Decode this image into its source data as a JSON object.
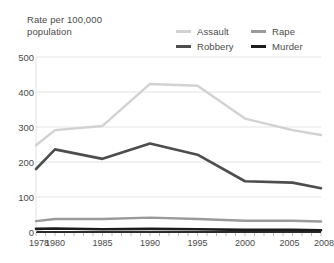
{
  "chart_data": {
    "type": "line",
    "title": "Rate per 100,000\npopulation",
    "xlabel": "",
    "ylabel": "Rate per 100,000 population",
    "x": [
      1978,
      1980,
      1985,
      1990,
      1995,
      2000,
      2005,
      2008
    ],
    "xticklabels": [
      "1978",
      "1980",
      "1985",
      "1990",
      "1995",
      "2000",
      "2005",
      "2008"
    ],
    "yticklabels": [
      "0",
      "100",
      "200",
      "300",
      "400",
      "500"
    ],
    "yticks": [
      0,
      100,
      200,
      300,
      400,
      500
    ],
    "ylim": [
      0,
      500
    ],
    "grid": "horizontal",
    "legend_position": "top-right",
    "series": [
      {
        "name": "Assault",
        "color": "#d2d2d2",
        "values": [
          248,
          291,
          303,
          423,
          418,
          324,
          291,
          277
        ]
      },
      {
        "name": "Rape",
        "color": "#9a9a9a",
        "values": [
          31,
          37,
          37,
          41,
          37,
          32,
          32,
          30
        ]
      },
      {
        "name": "Robbery",
        "color": "#4d4d4d",
        "values": [
          180,
          236,
          209,
          253,
          221,
          145,
          141,
          125
        ]
      },
      {
        "name": "Murder",
        "color": "#1c1c1c",
        "values": [
          9,
          10,
          8,
          9,
          8,
          6,
          6,
          5
        ]
      }
    ]
  },
  "colors": {
    "grid": "#e3e3e3",
    "axis": "#2b2b2b",
    "text": "#4a4a4a",
    "background": "#ffffff"
  }
}
